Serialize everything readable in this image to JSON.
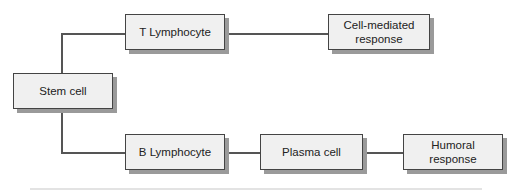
{
  "diagram": {
    "type": "flowchart",
    "nodes": {
      "stem_cell": "Stem cell",
      "t_lymphocyte": "T Lymphocyte",
      "cell_mediated": "Cell-mediated\nresponse",
      "b_lymphocyte": "B Lymphocyte",
      "plasma_cell": "Plasma cell",
      "humoral": "Humoral\nresponse"
    },
    "edges": [
      [
        "Stem cell",
        "T Lymphocyte"
      ],
      [
        "T Lymphocyte",
        "Cell-mediated response"
      ],
      [
        "Stem cell",
        "B Lymphocyte"
      ],
      [
        "B Lymphocyte",
        "Plasma cell"
      ],
      [
        "Plasma cell",
        "Humoral response"
      ]
    ]
  }
}
